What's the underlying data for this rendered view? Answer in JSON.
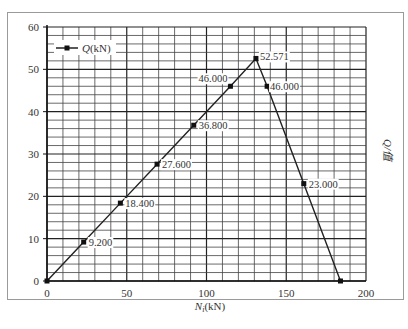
{
  "chart_data": {
    "type": "line",
    "title": "",
    "xlabel": "N_i(kN)",
    "ylabel_right": "Q/值",
    "xlim": [
      0,
      200
    ],
    "ylim": [
      0,
      60
    ],
    "x_ticks": [
      0,
      50,
      100,
      150,
      200
    ],
    "y_ticks": [
      0,
      10,
      20,
      30,
      40,
      50,
      60
    ],
    "grid": true,
    "grid_minor_x_step": 10,
    "grid_minor_y_step": 2,
    "legend": {
      "position": "upper-left",
      "entries": [
        "Q(kN)"
      ]
    },
    "series": [
      {
        "name": "Q(kN)",
        "marker": "square",
        "color": "#222222",
        "x": [
          0,
          23,
          46,
          69,
          92,
          115,
          131,
          138,
          161,
          184
        ],
        "y": [
          0,
          9.2,
          18.4,
          27.6,
          36.8,
          46.0,
          52.571,
          46.0,
          23.0,
          0
        ],
        "labels": [
          "",
          "9.200",
          "18.400",
          "27.600",
          "36.800",
          "46.000",
          "52.571",
          "46.000",
          "23.000",
          ""
        ]
      }
    ]
  },
  "legend_label": "Q(kN)",
  "x_axis_label": "N_i(kN)",
  "right_axis_label": "Q/值"
}
